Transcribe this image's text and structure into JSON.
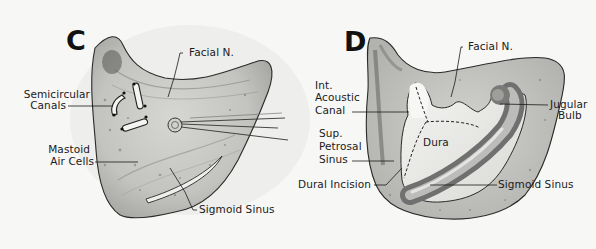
{
  "figure": {
    "panels": [
      {
        "id": "C",
        "letter": "C",
        "labels": {
          "facial_nerve": "Facial N.",
          "semicircular_1": "Semicircular",
          "semicircular_2": "Canals",
          "mastoid_1": "Mastoid",
          "mastoid_2": "Air Cells",
          "sigmoid_sinus": "Sigmoid Sinus"
        }
      },
      {
        "id": "D",
        "letter": "D",
        "labels": {
          "facial_nerve": "Facial N.",
          "iac_1": "Int.",
          "iac_2": "Acoustic",
          "iac_3": "Canal",
          "jugular_1": "Jugular",
          "jugular_2": "Bulb",
          "dura": "Dura",
          "sps_1": "Sup.",
          "sps_2": "Petrosal",
          "sps_3": "Sinus",
          "dural_incision": "Dural Incision",
          "sigmoid_sinus": "Sigmoid Sinus"
        }
      }
    ],
    "colors": {
      "background": "#f7f7f6",
      "bone_outer": "#b9b9b6",
      "bone_inner": "#cfcfcc",
      "outline": "#2a2a2a",
      "dura": "#ececea",
      "sinus_dark": "#6e6e6c",
      "sinus_light": "#d8d8d6"
    }
  }
}
